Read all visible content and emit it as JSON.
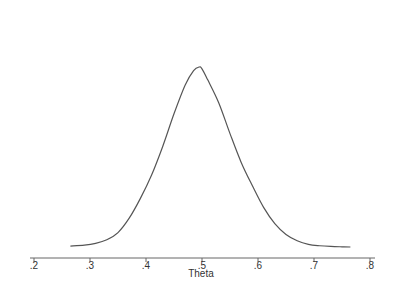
{
  "chart_data": {
    "type": "line",
    "title": "",
    "xlabel": "Theta",
    "ylabel": "",
    "x_ticks": [
      0.2,
      0.3,
      0.4,
      0.5,
      0.6,
      0.7,
      0.8
    ],
    "x_tick_labels": [
      ".2",
      ".3",
      ".4",
      ".5",
      ".6",
      ".7",
      ".8"
    ],
    "xlim": [
      0.2,
      0.8
    ],
    "grid": false,
    "legend": null,
    "series": [
      {
        "name": "density",
        "color": "#555555",
        "x": [
          0.265,
          0.29,
          0.31,
          0.33,
          0.35,
          0.37,
          0.39,
          0.41,
          0.43,
          0.45,
          0.47,
          0.485,
          0.495,
          0.5,
          0.51,
          0.53,
          0.55,
          0.57,
          0.59,
          0.61,
          0.63,
          0.65,
          0.67,
          0.69,
          0.71,
          0.73,
          0.75,
          0.765
        ],
        "y": [
          0.005,
          0.01,
          0.02,
          0.04,
          0.08,
          0.16,
          0.27,
          0.4,
          0.56,
          0.74,
          0.9,
          0.98,
          1.0,
          0.99,
          0.93,
          0.8,
          0.63,
          0.47,
          0.34,
          0.22,
          0.13,
          0.07,
          0.035,
          0.015,
          0.007,
          0.003,
          0.001,
          0.0
        ]
      }
    ]
  }
}
